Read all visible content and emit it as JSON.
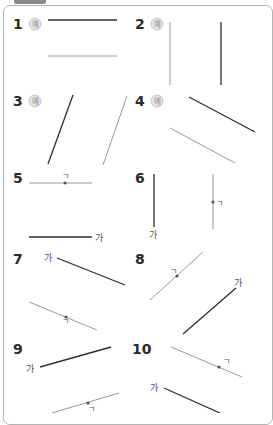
{
  "header": {
    "tab_label": "SSab"
  },
  "colors": {
    "dark_line": "#2e2e2e",
    "light_line": "#9a9a9a",
    "dot": "#555555",
    "border": "#b4b4b4"
  },
  "example_badge": "예",
  "problems": [
    {
      "number": "1",
      "x": 13,
      "y": 29,
      "example": true,
      "lines": [
        {
          "x1": 48,
          "y1": 20,
          "x2": 117,
          "y2": 20,
          "tone": "dark"
        },
        {
          "x1": 48,
          "y1": 56,
          "x2": 117,
          "y2": 56,
          "tone": "light"
        }
      ]
    },
    {
      "number": "2",
      "x": 135,
      "y": 29,
      "example": true,
      "lines": [
        {
          "x1": 170,
          "y1": 22,
          "x2": 170,
          "y2": 85,
          "tone": "light"
        },
        {
          "x1": 221,
          "y1": 22,
          "x2": 221,
          "y2": 85,
          "tone": "dark"
        }
      ]
    },
    {
      "number": "3",
      "x": 13,
      "y": 106,
      "example": true,
      "lines": [
        {
          "x1": 73,
          "y1": 95,
          "x2": 48,
          "y2": 164,
          "tone": "dark"
        },
        {
          "x1": 127,
          "y1": 96,
          "x2": 103,
          "y2": 165,
          "tone": "light"
        }
      ]
    },
    {
      "number": "4",
      "x": 135,
      "y": 106,
      "example": true,
      "lines": [
        {
          "x1": 189,
          "y1": 97,
          "x2": 255,
          "y2": 132,
          "tone": "dark"
        },
        {
          "x1": 170,
          "y1": 128,
          "x2": 235,
          "y2": 163,
          "tone": "light"
        }
      ]
    },
    {
      "number": "5",
      "x": 13,
      "y": 183,
      "example": false,
      "lines": [
        {
          "x1": 29,
          "y1": 183,
          "x2": 92,
          "y2": 183,
          "tone": "light",
          "dot": {
            "x": 65,
            "y": 183,
            "label": "ㄱ",
            "lx": 62,
            "ly": 179
          }
        },
        {
          "x1": 29,
          "y1": 237,
          "x2": 92,
          "y2": 237,
          "tone": "dark",
          "end_label": {
            "text": "가",
            "x": 95,
            "y": 241
          }
        }
      ]
    },
    {
      "number": "6",
      "x": 135,
      "y": 183,
      "example": false,
      "lines": [
        {
          "x1": 154,
          "y1": 174,
          "x2": 154,
          "y2": 227,
          "tone": "dark",
          "end_label": {
            "text": "가",
            "x": 149,
            "y": 238
          }
        },
        {
          "x1": 213,
          "y1": 174,
          "x2": 213,
          "y2": 229,
          "tone": "light",
          "dot": {
            "x": 213,
            "y": 202,
            "label": "ㄱ",
            "lx": 216,
            "ly": 206
          }
        }
      ]
    },
    {
      "number": "7",
      "x": 13,
      "y": 264,
      "example": false,
      "lines": [
        {
          "x1": 57,
          "y1": 258,
          "x2": 125,
          "y2": 285,
          "tone": "dark",
          "start_label": {
            "text": "가",
            "x": 44,
            "y": 261
          }
        },
        {
          "x1": 29,
          "y1": 302,
          "x2": 97,
          "y2": 330,
          "tone": "light",
          "dot": {
            "x": 66,
            "y": 317,
            "label": "ㄱ",
            "lx": 62,
            "ly": 324
          }
        }
      ]
    },
    {
      "number": "8",
      "x": 135,
      "y": 264,
      "example": false,
      "lines": [
        {
          "x1": 203,
          "y1": 252,
          "x2": 150,
          "y2": 300,
          "tone": "light",
          "dot": {
            "x": 177,
            "y": 276,
            "label": "ㄱ",
            "lx": 170,
            "ly": 274
          }
        },
        {
          "x1": 236,
          "y1": 288,
          "x2": 183,
          "y2": 334,
          "tone": "dark",
          "end_label": {
            "text": "가",
            "x": 234,
            "y": 286,
            "anchor": "start"
          }
        }
      ]
    },
    {
      "number": "9",
      "x": 13,
      "y": 354,
      "example": false,
      "lines": [
        {
          "x1": 40,
          "y1": 367,
          "x2": 111,
          "y2": 347,
          "tone": "dark",
          "start_label": {
            "text": "가",
            "x": 26,
            "y": 372
          }
        },
        {
          "x1": 52,
          "y1": 413,
          "x2": 119,
          "y2": 393,
          "tone": "light",
          "dot": {
            "x": 88,
            "y": 403,
            "label": "ㄱ",
            "lx": 88,
            "ly": 412
          }
        }
      ]
    },
    {
      "number": "10",
      "x": 132,
      "y": 354,
      "example": false,
      "lines": [
        {
          "x1": 171,
          "y1": 347,
          "x2": 242,
          "y2": 377,
          "tone": "light",
          "dot": {
            "x": 219,
            "y": 367,
            "label": "ㄱ",
            "lx": 223,
            "ly": 364
          }
        },
        {
          "x1": 164,
          "y1": 388,
          "x2": 220,
          "y2": 413,
          "tone": "dark",
          "start_label": {
            "text": "가",
            "x": 150,
            "y": 391
          }
        }
      ]
    }
  ]
}
